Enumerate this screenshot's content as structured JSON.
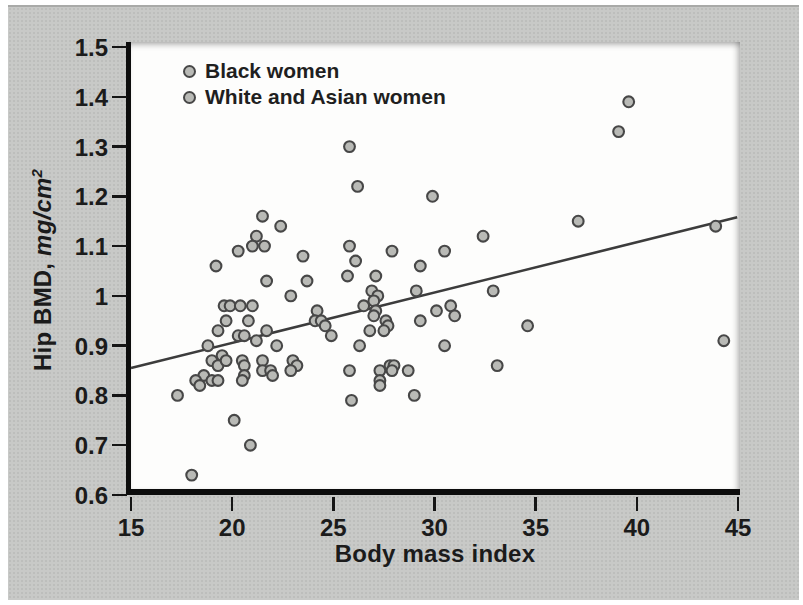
{
  "figure": {
    "legend": [
      {
        "label": "Black women",
        "marker": "gray-circle"
      },
      {
        "label": "White and Asian women",
        "marker": "gray-circle"
      }
    ],
    "x_axis": {
      "title": "Body mass index"
    },
    "y_axis": {
      "title_prefix": "Hip BMD, ",
      "title_unit": "mg/cm",
      "title_unit_exponent": "2"
    },
    "colors": {
      "card_background": "#c8c9c7",
      "panel_background": "#fdfdfc",
      "marker_fill": "#b9bab6",
      "marker_stroke": "#474747",
      "trend_line": "#3c3c3c",
      "axis": "#0d0d0d",
      "text": "#1b1b1b"
    }
  },
  "chart_data": {
    "type": "scatter",
    "title": "",
    "xlabel": "Body mass index",
    "ylabel": "Hip BMD, mg/cm2",
    "xlim": [
      15,
      45
    ],
    "ylim": [
      0.6,
      1.5
    ],
    "x_ticks": [
      "15",
      "20",
      "25",
      "30",
      "35",
      "40",
      "45"
    ],
    "y_ticks": [
      "1.5",
      "1.4",
      "1.3",
      "1.2",
      "1.1",
      "1",
      "0.9",
      "0.8",
      "0.7",
      "0.6"
    ],
    "grid": false,
    "legend_position": "top-left-inside",
    "legend": [
      "Black women",
      "White and Asian women"
    ],
    "points": [
      [
        39.6,
        1.39
      ],
      [
        39.1,
        1.33
      ],
      [
        25.8,
        1.3
      ],
      [
        26.2,
        1.22
      ],
      [
        29.9,
        1.2
      ],
      [
        37.1,
        1.15
      ],
      [
        21.5,
        1.16
      ],
      [
        22.4,
        1.14
      ],
      [
        43.9,
        1.14
      ],
      [
        32.4,
        1.12
      ],
      [
        21.2,
        1.12
      ],
      [
        21.0,
        1.1
      ],
      [
        21.6,
        1.1
      ],
      [
        20.3,
        1.09
      ],
      [
        23.5,
        1.08
      ],
      [
        25.8,
        1.1
      ],
      [
        27.9,
        1.09
      ],
      [
        30.5,
        1.09
      ],
      [
        19.2,
        1.06
      ],
      [
        26.1,
        1.07
      ],
      [
        29.3,
        1.06
      ],
      [
        25.7,
        1.04
      ],
      [
        27.1,
        1.04
      ],
      [
        21.7,
        1.03
      ],
      [
        23.7,
        1.03
      ],
      [
        32.9,
        1.01
      ],
      [
        26.9,
        1.01
      ],
      [
        27.2,
        1.0
      ],
      [
        29.1,
        1.01
      ],
      [
        22.9,
        1.0
      ],
      [
        27.0,
        0.99
      ],
      [
        26.5,
        0.98
      ],
      [
        27.1,
        0.97
      ],
      [
        30.1,
        0.97
      ],
      [
        30.8,
        0.98
      ],
      [
        31.0,
        0.96
      ],
      [
        19.6,
        0.98
      ],
      [
        19.9,
        0.98
      ],
      [
        20.4,
        0.98
      ],
      [
        21.0,
        0.98
      ],
      [
        24.2,
        0.97
      ],
      [
        24.1,
        0.95
      ],
      [
        24.4,
        0.95
      ],
      [
        24.6,
        0.94
      ],
      [
        24.9,
        0.92
      ],
      [
        19.7,
        0.95
      ],
      [
        20.8,
        0.95
      ],
      [
        27.0,
        0.96
      ],
      [
        27.6,
        0.95
      ],
      [
        27.7,
        0.94
      ],
      [
        29.3,
        0.95
      ],
      [
        34.6,
        0.94
      ],
      [
        26.8,
        0.93
      ],
      [
        27.5,
        0.93
      ],
      [
        19.3,
        0.93
      ],
      [
        20.3,
        0.92
      ],
      [
        20.6,
        0.92
      ],
      [
        21.2,
        0.91
      ],
      [
        21.7,
        0.93
      ],
      [
        22.2,
        0.9
      ],
      [
        18.8,
        0.9
      ],
      [
        19.5,
        0.88
      ],
      [
        26.3,
        0.9
      ],
      [
        30.5,
        0.9
      ],
      [
        44.3,
        0.91
      ],
      [
        19.0,
        0.87
      ],
      [
        19.3,
        0.86
      ],
      [
        19.7,
        0.87
      ],
      [
        20.5,
        0.87
      ],
      [
        20.6,
        0.86
      ],
      [
        20.6,
        0.84
      ],
      [
        20.5,
        0.83
      ],
      [
        21.5,
        0.87
      ],
      [
        21.5,
        0.85
      ],
      [
        21.9,
        0.85
      ],
      [
        22.0,
        0.84
      ],
      [
        23.0,
        0.87
      ],
      [
        23.2,
        0.86
      ],
      [
        22.9,
        0.85
      ],
      [
        18.6,
        0.84
      ],
      [
        19.0,
        0.83
      ],
      [
        19.3,
        0.83
      ],
      [
        18.2,
        0.83
      ],
      [
        18.4,
        0.82
      ],
      [
        17.3,
        0.8
      ],
      [
        25.8,
        0.85
      ],
      [
        27.3,
        0.85
      ],
      [
        27.8,
        0.86
      ],
      [
        28.0,
        0.86
      ],
      [
        27.9,
        0.85
      ],
      [
        28.7,
        0.85
      ],
      [
        27.3,
        0.83
      ],
      [
        27.3,
        0.82
      ],
      [
        33.1,
        0.86
      ],
      [
        25.9,
        0.79
      ],
      [
        29.0,
        0.8
      ],
      [
        20.1,
        0.75
      ],
      [
        20.9,
        0.7
      ],
      [
        18.0,
        0.64
      ]
    ],
    "trend_line": {
      "x": [
        15.0,
        44.96
      ],
      "y": [
        0.855,
        1.158
      ]
    }
  }
}
